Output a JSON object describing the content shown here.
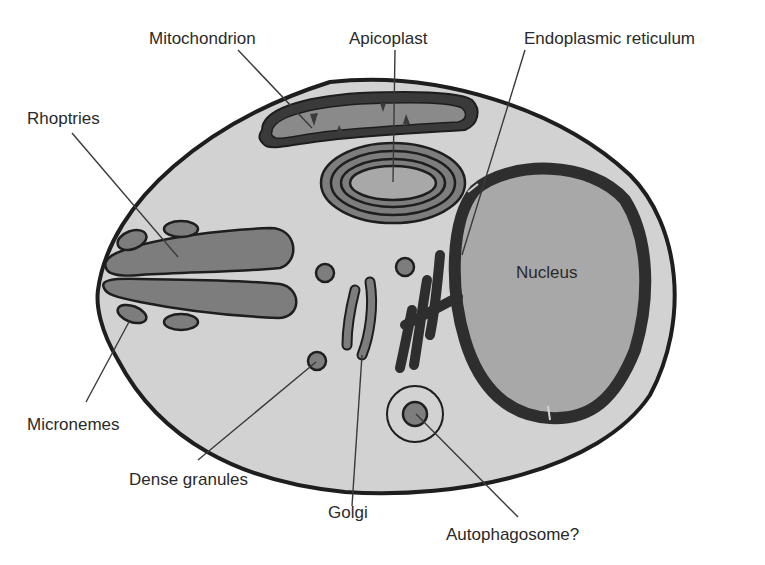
{
  "figure": {
    "colors": {
      "background": "#ffffff",
      "cytoplasm": "#d2d2d2",
      "organelle": "#7d7d7d",
      "outline": "#1e1e1e",
      "nucleus": "#a8a8a8",
      "label_text": "#2a2a2a"
    },
    "labels": [
      {
        "id": "mitochondrion",
        "text": "Mitochondrion"
      },
      {
        "id": "apicoplast",
        "text": "Apicoplast"
      },
      {
        "id": "endoplasmic-reticulum",
        "text": "Endoplasmic reticulum"
      },
      {
        "id": "rhoptries",
        "text": "Rhoptries"
      },
      {
        "id": "nucleus",
        "text": "Nucleus"
      },
      {
        "id": "micronemes",
        "text": "Micronemes"
      },
      {
        "id": "dense-granules",
        "text": "Dense granules"
      },
      {
        "id": "golgi",
        "text": "Golgi"
      },
      {
        "id": "autophagosome",
        "text": "Autophagosome?"
      }
    ]
  }
}
